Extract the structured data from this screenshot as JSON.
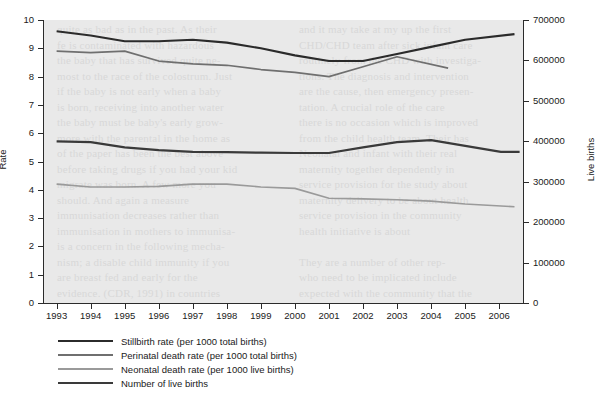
{
  "chart_data": {
    "type": "line",
    "title": "",
    "xlabel": "",
    "ylabel": "Rate",
    "ylabel_secondary": "Live births",
    "x": [
      1993,
      1994,
      1995,
      1996,
      1997,
      1998,
      1999,
      2000,
      2001,
      2002,
      2003,
      2004,
      2005,
      2006
    ],
    "xtick_labels": [
      "1993",
      "1994",
      "1995",
      "1996",
      "1997",
      "1998",
      "1999",
      "2000",
      "2001",
      "2002",
      "2003",
      "2004",
      "2005",
      "2006"
    ],
    "xlim": [
      1992.6,
      2006.7
    ],
    "ylim": [
      0,
      10
    ],
    "ytick_labels": [
      "0",
      "1",
      "2",
      "3",
      "4",
      "5",
      "6",
      "7",
      "8",
      "9",
      "10"
    ],
    "ytick_values": [
      0,
      1,
      2,
      3,
      4,
      5,
      6,
      7,
      8,
      9,
      10
    ],
    "ylim_secondary": [
      0,
      700000
    ],
    "ytick_labels_secondary": [
      "0",
      "100000",
      "200000",
      "300000",
      "400000",
      "500000",
      "600000",
      "700000"
    ],
    "ytick_values_secondary": [
      0,
      100000,
      200000,
      300000,
      400000,
      500000,
      600000,
      700000
    ],
    "grid": false,
    "legend_position": "below-left",
    "series": [
      {
        "name": "Stillbirth rate (per 1000 total births)",
        "axis": "left",
        "color": "#2b2b2b",
        "width": 2.1,
        "x": [
          1993,
          1994,
          1995,
          1996,
          1997,
          1998,
          1999,
          2000,
          2001,
          2002,
          2003,
          2004,
          2005,
          2006.45
        ],
        "values": [
          9.6,
          9.45,
          9.25,
          9.25,
          9.3,
          9.2,
          9.0,
          8.75,
          8.55,
          8.55,
          8.8,
          9.05,
          9.3,
          9.5
        ]
      },
      {
        "name": "Perinatal death rate (per 1000 total births)",
        "axis": "left",
        "color": "#6f6f6f",
        "width": 1.7,
        "x": [
          1993,
          1994,
          1995,
          1996,
          1997,
          1998,
          1999,
          2000,
          2001,
          2002,
          2003,
          2004.5
        ],
        "values": [
          8.9,
          8.85,
          8.9,
          8.55,
          8.45,
          8.4,
          8.25,
          8.15,
          8.0,
          8.35,
          8.7,
          8.3
        ]
      },
      {
        "name": "Neonatal death rate (per 1000 live births)",
        "axis": "left",
        "color": "#9a9a9a",
        "width": 1.6,
        "x": [
          1993,
          1994,
          1995,
          1996,
          1997,
          1998,
          1999,
          2000,
          2001,
          2002,
          2003,
          2004,
          2005,
          2006.45
        ],
        "values": [
          4.2,
          4.1,
          4.1,
          4.12,
          4.2,
          4.2,
          4.1,
          4.05,
          3.7,
          3.68,
          3.65,
          3.6,
          3.5,
          3.4
        ]
      },
      {
        "name": "Number of live births",
        "axis": "right",
        "color": "#3a3a3a",
        "width": 2.2,
        "x": [
          1993,
          1994,
          1995,
          1996,
          1997,
          1998,
          1999,
          2000,
          2001,
          2002,
          2003,
          2004,
          2006.05,
          2006.6
        ],
        "values": [
          400000,
          398000,
          385000,
          378000,
          374000,
          373000,
          372000,
          371000,
          371000,
          385000,
          398000,
          403000,
          374000,
          374000
        ]
      }
    ],
    "legend": [
      "Stillbirth rate (per 1000 total births)",
      "Perinatal death rate (per 1000 total births)",
      "Neonatal death rate (per 1000 live births)",
      "Number of live births"
    ]
  },
  "background": {
    "plot_fill": "#e9e9e9",
    "page_fill": "#ffffff",
    "bleed_left": "quite as bad as in the past. As their\nfe is contaminated with hazardous\nthe baby that has survived quite ne-\nmost to the race of the colostrum. Just\nif the baby is not early when a baby\nis born, receiving into another water\nthe baby must be baby's early grow-\nmore with the parental in the home as\nof the paper has been the best above\nbefore taking drugs if you had your kid\nmigrate was born. A few more you\nshould. And again a measure\nimmunisation decreases rather than\nimmunisation in mothers to immunisa-\nis a concern in the following mecha-\nnism; a disable child immunity if you\nare breast fed and early for the\nevidence. (CDR, 1991) in countries",
    "bleed_right": "and it may take at my up the first\nCHD/CHD team after sick infant care\nroutinely from the CHD with investiga-\ntions. The diagnosis and intervention\nare the cause, then emergency presen-\ntation. A crucial role of the care\nthere is no occasion which is improved\nfrom the child health team. Their has\nNeonatal and infant with their real\nmaternity together dependently in\nservice provision for the study about\nmaternity delivery to be about health\nservice provision in the community\nhealth initiative is about\n\nThey are a number of other rep-\nwho need to be implicated include\nexpected with the community that the"
  }
}
